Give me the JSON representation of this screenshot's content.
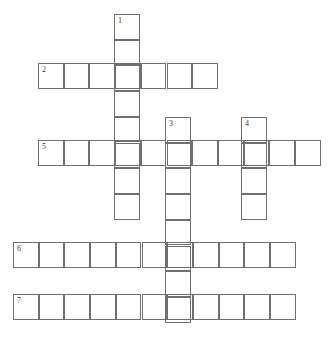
{
  "puzzle": {
    "title": "Crossword Puzzle Grid",
    "background_color": "#ffffff",
    "cell_border_color": "#6f6f6f",
    "number_color": "#3a3a3a",
    "cell_size": 25.7,
    "grid_width": 328,
    "grid_height": 337,
    "entries": [
      {
        "number": "1",
        "direction": "down",
        "length": 8,
        "x": 114,
        "y": 14,
        "cells": [
          "",
          "",
          "",
          "",
          "",
          "",
          "",
          ""
        ]
      },
      {
        "number": "2",
        "direction": "across",
        "length": 7,
        "x": 38,
        "y": 63,
        "cells": [
          "",
          "",
          "",
          "",
          "",
          "",
          ""
        ]
      },
      {
        "number": "3",
        "direction": "down",
        "length": 8,
        "x": 165,
        "y": 117,
        "cells": [
          "",
          "",
          "",
          "",
          "",
          "",
          "",
          ""
        ]
      },
      {
        "number": "4",
        "direction": "down",
        "length": 4,
        "x": 241,
        "y": 117,
        "cells": [
          "",
          "",
          "",
          ""
        ]
      },
      {
        "number": "5",
        "direction": "across",
        "length": 11,
        "x": 38,
        "y": 140,
        "cells": [
          "",
          "",
          "",
          "",
          "",
          "",
          "",
          "",
          "",
          "",
          ""
        ]
      },
      {
        "number": "6",
        "direction": "across",
        "length": 11,
        "x": 13,
        "y": 242,
        "cells": [
          "",
          "",
          "",
          "",
          "",
          "",
          "",
          "",
          "",
          "",
          ""
        ]
      },
      {
        "number": "7",
        "direction": "across",
        "length": 11,
        "x": 13,
        "y": 294,
        "cells": [
          "",
          "",
          "",
          "",
          "",
          "",
          "",
          "",
          "",
          "",
          ""
        ]
      }
    ]
  }
}
